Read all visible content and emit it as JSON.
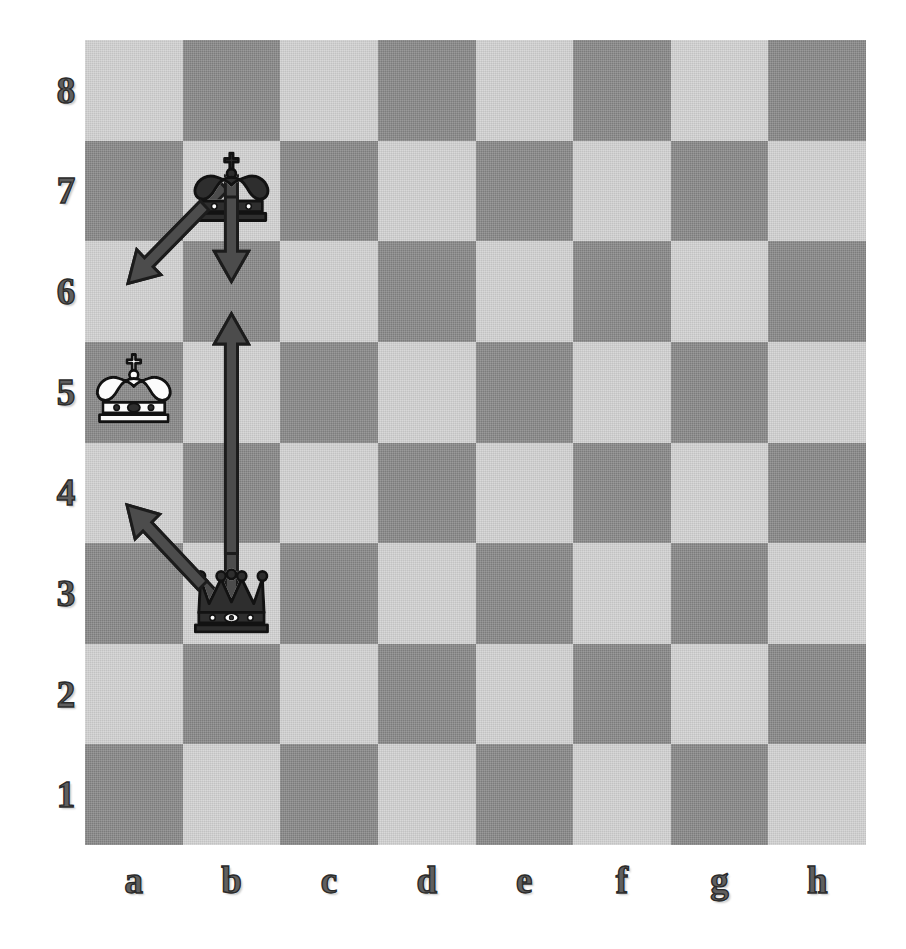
{
  "diagram": {
    "board": {
      "files": [
        "a",
        "b",
        "c",
        "d",
        "e",
        "f",
        "g",
        "h"
      ],
      "ranks": [
        "8",
        "7",
        "6",
        "5",
        "4",
        "3",
        "2",
        "1"
      ],
      "orientation": "white-bottom",
      "light_square_color": "#d2d2d2",
      "dark_square_color": "#878787",
      "a8_color": "light",
      "squares": 64
    },
    "pieces": [
      {
        "id": "black-king-b7",
        "type": "king",
        "color": "black",
        "square": "b7",
        "file": 1,
        "rank": 7,
        "glyph": "♚",
        "name": "black-king-piece"
      },
      {
        "id": "white-king-a5",
        "type": "king",
        "color": "white",
        "square": "a5",
        "file": 0,
        "rank": 5,
        "glyph": "♔",
        "name": "white-king-piece"
      },
      {
        "id": "black-queen-b3",
        "type": "queen",
        "color": "black",
        "square": "b3",
        "file": 1,
        "rank": 3,
        "glyph": "♛",
        "name": "black-queen-piece"
      }
    ],
    "arrows": [
      {
        "id": "arrow-b7-a6",
        "from": "b7",
        "to": "a6",
        "kind": "diagonal",
        "x1": 1.42,
        "y1": 1.45,
        "x2": 0.44,
        "y2": 2.42,
        "color": "#4c4c4c",
        "outline": "#1c1c1c",
        "name": "arrow-b7-to-a6"
      },
      {
        "id": "arrow-b7-b6",
        "from": "b7",
        "to": "b6",
        "kind": "vertical-down",
        "x1": 1.5,
        "y1": 1.35,
        "x2": 1.5,
        "y2": 2.4,
        "color": "#4c4c4c",
        "outline": "#1c1c1c",
        "name": "arrow-b7-to-b6"
      },
      {
        "id": "arrow-b3-b6",
        "from": "b3",
        "to": "b6",
        "kind": "vertical-up-long",
        "x1": 1.5,
        "y1": 5.7,
        "x2": 1.5,
        "y2": 2.72,
        "color": "#4c4c4c",
        "outline": "#1c1c1c",
        "name": "arrow-b3-to-b6"
      },
      {
        "id": "arrow-b3-a4",
        "from": "b3",
        "to": "a4",
        "kind": "diagonal",
        "x1": 1.4,
        "y1": 5.62,
        "x2": 0.43,
        "y2": 4.62,
        "color": "#4c4c4c",
        "outline": "#1c1c1c",
        "name": "arrow-b3-to-a4"
      }
    ],
    "colors": {
      "light_square": "#d2d2d2",
      "dark_square": "#878787",
      "arrow_fill": "#4c4c4c",
      "arrow_outline": "#1c1c1c",
      "label_text": "#5f5f5f",
      "white_piece_fill": "#fbfbfb",
      "black_piece_fill": "#2e2e2e",
      "piece_outline": "#121212",
      "background": "#ffffff"
    }
  }
}
